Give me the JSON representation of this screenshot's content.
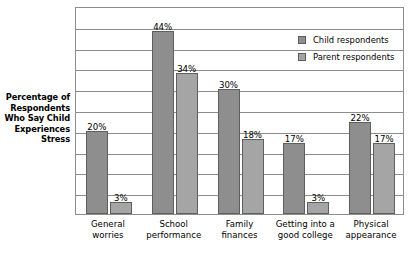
{
  "chart_data": {
    "type": "bar",
    "title": "",
    "subtitle": "",
    "xlabel": "",
    "ylabel": "Percentage of Respondents Who Say Child Experiences Stress",
    "ylabel_lines": [
      "Percentage of",
      "Respondents",
      "Who Say Child",
      "Experiences",
      "Stress"
    ],
    "categories": [
      "General worries",
      "School performance",
      "Family finances",
      "Getting into a good college",
      "Physical appearance"
    ],
    "category_lines": [
      [
        "General",
        "worries"
      ],
      [
        "School",
        "performance"
      ],
      [
        "Family",
        "finances"
      ],
      [
        "Getting into a",
        "good college"
      ],
      [
        "Physical",
        "appearance"
      ]
    ],
    "series": [
      {
        "name": "Child respondents",
        "color": "#8e8e8e",
        "values": [
          20,
          44,
          30,
          17,
          22
        ],
        "labels": [
          "20%",
          "44%",
          "30%",
          "17%",
          "22%"
        ]
      },
      {
        "name": "Parent respondents",
        "color": "#a5a5a5",
        "values": [
          3,
          34,
          18,
          3,
          17
        ],
        "labels": [
          "3%",
          "34%",
          "18%",
          "3%",
          "17%"
        ]
      }
    ],
    "ylim": [
      0,
      50
    ],
    "y_tick_interval": 5,
    "y_tick_labels_visible": false,
    "grid": true,
    "grid_axis": "y",
    "grid_color": "#8d8d8d",
    "legend_position": "top-right",
    "value_labels_shown": true,
    "plot_border_color": "#8d8d8d",
    "background_color": "#ffffff"
  },
  "legend": {
    "items": [
      {
        "label": "Child respondents",
        "swatch": "child"
      },
      {
        "label": "Parent respondents",
        "swatch": "parent"
      }
    ]
  }
}
